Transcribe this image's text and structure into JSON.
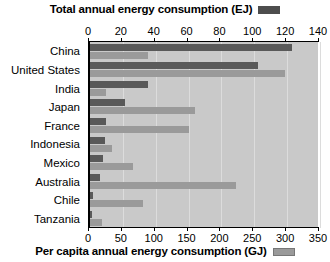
{
  "legend": {
    "top": {
      "label": "Total annual energy consumption (EJ)",
      "swatch_name": "total-legend-swatch",
      "color": "#4d4d4d"
    },
    "bottom": {
      "label": "Per capita annual energy consumption (GJ)",
      "swatch_name": "percapita-legend-swatch",
      "color": "#9a9a9a"
    }
  },
  "chart_data": {
    "type": "bar",
    "orientation": "horizontal",
    "title": "",
    "categories": [
      "China",
      "United States",
      "India",
      "Japan",
      "France",
      "Indonesia",
      "Mexico",
      "Australia",
      "Chile",
      "Tanzania"
    ],
    "series": [
      {
        "name": "Total annual energy consumption (EJ)",
        "unit": "EJ",
        "axis": "top",
        "color": "#595959",
        "values": [
          123,
          102,
          35,
          21,
          10,
          9,
          8,
          6,
          2,
          1
        ]
      },
      {
        "name": "Per capita annual energy consumption (GJ)",
        "unit": "GJ",
        "axis": "bottom",
        "color": "#9a9a9a",
        "values": [
          88,
          296,
          25,
          160,
          150,
          33,
          65,
          222,
          80,
          18
        ]
      }
    ],
    "top_axis": {
      "label": "Total annual energy consumption (EJ)",
      "min": 0,
      "max": 140,
      "step": 20,
      "ticks": [
        0,
        20,
        40,
        60,
        80,
        100,
        120,
        140
      ]
    },
    "bottom_axis": {
      "label": "Per capita annual energy consumption (GJ)",
      "min": 0,
      "max": 350,
      "step": 50,
      "ticks": [
        0,
        50,
        100,
        150,
        200,
        250,
        300,
        350
      ]
    },
    "xlabel": "",
    "ylabel": "",
    "grid": true,
    "legend_position": "top and bottom",
    "plot_background": "#c9c9c9"
  }
}
